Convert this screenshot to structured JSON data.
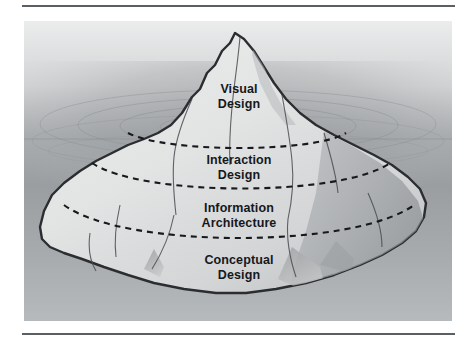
{
  "figure": {
    "panel": {
      "background_top_color": "#e8e9ea",
      "background_bottom_color": "#9a9d9f",
      "waterline_y": 105
    },
    "iceberg": {
      "above_water_fill": "#e9eaea",
      "below_water_fill": "#d9dadb",
      "shadow_fill": "#9fa2a4",
      "outline_color": "#2b2d30",
      "divider_style": "dashed",
      "divider_color": "#1d1f22"
    },
    "zones": [
      {
        "id": "visual-design",
        "line1": "Visual",
        "line2": "Design",
        "position": "above-water"
      },
      {
        "id": "interaction-design",
        "line1": "Interaction",
        "line2": "Design",
        "position": "below-water"
      },
      {
        "id": "information-architecture",
        "line1": "Information",
        "line2": "Architecture",
        "position": "below-water"
      },
      {
        "id": "conceptual-design",
        "line1": "Conceptual",
        "line2": "Design",
        "position": "below-water"
      }
    ],
    "rules": {
      "top_rule_color": "#5a5f63",
      "bottom_rule_color": "#5a5f63"
    }
  }
}
